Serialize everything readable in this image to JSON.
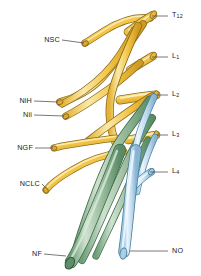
{
  "figure": {
    "background": "#ffffff",
    "colors": {
      "nerve_yellow_fill": "#f4c84a",
      "nerve_yellow_light": "#fbe9a8",
      "nerve_yellow_outline": "#8a6b1f",
      "nerve_green_fill": "#8fb494",
      "nerve_green_light": "#cfe2cf",
      "nerve_green_outline": "#3f6b48",
      "nerve_blue_fill": "#bcd9ec",
      "nerve_blue_light": "#e6f2fa",
      "nerve_blue_outline": "#4a7e9e",
      "leader_line": "#555555",
      "label_text": "#1a1a1a"
    }
  },
  "labels": {
    "right": [
      {
        "id": "t12",
        "text": "T",
        "sub": "12",
        "x": 172,
        "y": 14,
        "leader": {
          "x1": 152,
          "y1": 16,
          "x2": 168,
          "y2": 16
        }
      },
      {
        "id": "l1",
        "text": "L",
        "sub": "1",
        "x": 172,
        "y": 55,
        "leader": {
          "x1": 152,
          "y1": 57,
          "x2": 168,
          "y2": 57
        }
      },
      {
        "id": "l2",
        "text": "L",
        "sub": "2",
        "x": 172,
        "y": 93,
        "leader": {
          "x1": 155,
          "y1": 95,
          "x2": 168,
          "y2": 95
        }
      },
      {
        "id": "l3",
        "text": "L",
        "sub": "3",
        "x": 172,
        "y": 133,
        "leader": {
          "x1": 155,
          "y1": 135,
          "x2": 168,
          "y2": 135
        }
      },
      {
        "id": "l4",
        "text": "L",
        "sub": "4",
        "x": 172,
        "y": 170,
        "leader": {
          "x1": 150,
          "y1": 172,
          "x2": 168,
          "y2": 172
        }
      },
      {
        "id": "no",
        "text": "NO",
        "sub": "",
        "x": 172,
        "y": 249,
        "leader": {
          "x1": 133,
          "y1": 251,
          "x2": 168,
          "y2": 251
        }
      }
    ],
    "left": [
      {
        "id": "nsc",
        "text": "NSC",
        "sub": "",
        "x": 58,
        "y": 38,
        "leader": {
          "x1": 62,
          "y1": 40,
          "x2": 86,
          "y2": 42
        }
      },
      {
        "id": "nih",
        "text": "NiH",
        "sub": "",
        "x": 30,
        "y": 99,
        "leader": {
          "x1": 34,
          "y1": 101,
          "x2": 58,
          "y2": 103
        }
      },
      {
        "id": "nii",
        "text": "Nii",
        "sub": "",
        "x": 30,
        "y": 113,
        "leader": {
          "x1": 34,
          "y1": 115,
          "x2": 64,
          "y2": 117
        }
      },
      {
        "id": "ngf",
        "text": "NGF",
        "sub": "",
        "x": 31,
        "y": 146,
        "leader": {
          "x1": 35,
          "y1": 148,
          "x2": 55,
          "y2": 148
        }
      },
      {
        "id": "nclc",
        "text": "NCLC",
        "sub": "",
        "x": 38,
        "y": 182,
        "leader": {
          "x1": 42,
          "y1": 184,
          "x2": 46,
          "y2": 185
        }
      },
      {
        "id": "nf",
        "text": "NF",
        "sub": "",
        "x": 40,
        "y": 252,
        "leader": {
          "x1": 44,
          "y1": 254,
          "x2": 66,
          "y2": 254
        }
      }
    ]
  },
  "legend_keys": {
    "T12": "twelfth thoracic root",
    "L1": "first lumbar root",
    "L2": "second lumbar root",
    "L3": "third lumbar root",
    "L4": "fourth lumbar root",
    "NSC": "nervus subcostalis",
    "NiH": "nervus iliohypogastricus",
    "Nii": "nervus ilioinguinalis",
    "NGF": "nervus genitofemoralis",
    "NCLC": "nervus cutaneus lateralis",
    "NF": "nervus femoralis",
    "NO": "nervus obturatorius"
  }
}
